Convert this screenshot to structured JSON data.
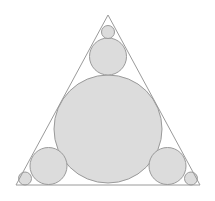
{
  "figure": {
    "canvas": {
      "width": 215,
      "height": 201,
      "background": "#ffffff"
    },
    "style": {
      "circle_fill": "#dcdcdc",
      "circle_stroke": "#9a9a9a",
      "triangle_stroke": "#9a9a9a",
      "triangle_fill": "none",
      "stroke_width": 1
    },
    "triangle": {
      "name": "equilateral-triangle",
      "vertices": [
        {
          "label": "apex",
          "x": 108,
          "y": 15
        },
        {
          "label": "bottom-left",
          "x": 16,
          "y": 185
        },
        {
          "label": "bottom-right",
          "x": 200,
          "y": 185
        }
      ],
      "points_attr": "108,15 16,185 200,185"
    },
    "circles": [
      {
        "name": "incircle",
        "role": "incircle",
        "cx": 108,
        "cy": 129,
        "r": 54
      },
      {
        "name": "medium-circle-top",
        "role": "corner-medium",
        "cx": 108,
        "cy": 56.5,
        "r": 18.5
      },
      {
        "name": "medium-circle-bottom-left",
        "role": "corner-medium",
        "cx": 48.5,
        "cy": 166,
        "r": 18.5
      },
      {
        "name": "medium-circle-bottom-right",
        "role": "corner-medium",
        "cx": 167.5,
        "cy": 166,
        "r": 18.5
      },
      {
        "name": "tiny-circle-apex",
        "role": "vertex-tiny",
        "cx": 108,
        "cy": 32,
        "r": 6.5
      },
      {
        "name": "tiny-circle-bottom-left",
        "role": "vertex-tiny",
        "cx": 25,
        "cy": 178.5,
        "r": 6.5
      },
      {
        "name": "tiny-circle-bottom-right",
        "role": "vertex-tiny",
        "cx": 191,
        "cy": 178.5,
        "r": 6.5
      }
    ]
  }
}
